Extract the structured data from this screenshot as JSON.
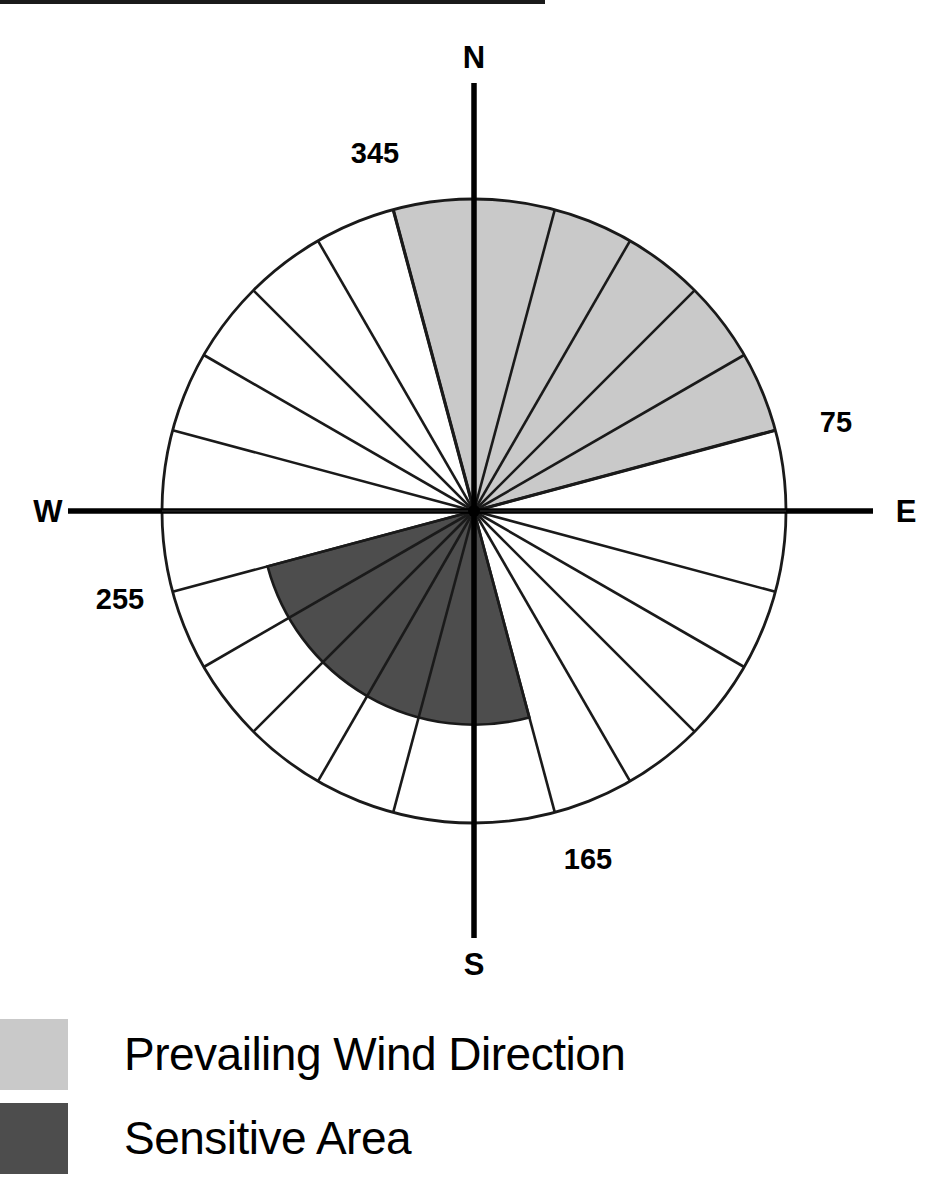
{
  "figure": {
    "name": "wind-rose-diagram",
    "top_rule_visible": true
  },
  "colors": {
    "prevailing_wind": "#c9c9c9",
    "sensitive_area": "#4d4d4d",
    "outline": "#1a1a1a",
    "background": "#ffffff"
  },
  "compass": {
    "north": "N",
    "east": "E",
    "south": "S",
    "west": "W"
  },
  "degree_labels": {
    "d345": "345",
    "d75": "75",
    "d165": "165",
    "d255": "255"
  },
  "legend": {
    "items": [
      {
        "label": "Prevailing Wind Direction",
        "color": "#c9c9c9",
        "swatch": "light-gray-swatch"
      },
      {
        "label": "Sensitive Area",
        "color": "#4d4d4d",
        "swatch": "dark-gray-swatch"
      }
    ]
  },
  "chart_data": {
    "type": "pie",
    "title": "",
    "subtitle": "",
    "xlabel": "",
    "ylabel": "",
    "legend_position": "bottom-left",
    "grid": false,
    "geometry": {
      "center_x": 474,
      "center_y": 511,
      "radius": 312,
      "sector_count": 24,
      "sector_span_degrees": 15
    },
    "axis_ticks": [
      0,
      90,
      180,
      270
    ],
    "axis_tick_labels": [
      "N",
      "E",
      "S",
      "W"
    ],
    "annotations": [
      {
        "text": "345",
        "bearing": 345
      },
      {
        "text": "75",
        "bearing": 75
      },
      {
        "text": "165",
        "bearing": 165
      },
      {
        "text": "255",
        "bearing": 255
      }
    ],
    "spoke_bearings": [
      0,
      15,
      30,
      45,
      60,
      75,
      90,
      105,
      120,
      135,
      150,
      165,
      180,
      195,
      210,
      225,
      240,
      255,
      270,
      285,
      300,
      315,
      330,
      345
    ],
    "series": [
      {
        "name": "Prevailing Wind Direction",
        "color": "#c9c9c9",
        "start_bearing": 345,
        "end_bearing": 75,
        "span_degrees": 90,
        "radius_fraction": 1.0
      },
      {
        "name": "Sensitive Area",
        "color": "#4d4d4d",
        "start_bearing": 165,
        "end_bearing": 255,
        "span_degrees": 90,
        "radius_fraction": 0.685
      }
    ],
    "categories": [
      "Prevailing Wind Direction",
      "Sensitive Area"
    ],
    "values": [
      90,
      90
    ]
  }
}
